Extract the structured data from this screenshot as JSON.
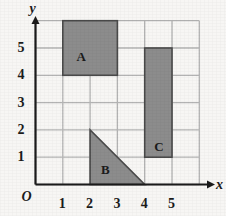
{
  "figure": {
    "title": "",
    "background_color": "#f7f6f4",
    "grid_color": "#b3b3b3",
    "axis_color": "#1b1b1b",
    "shape_fill": "#8c8c8c",
    "shape_stroke": "#4a4a4a"
  },
  "axes": {
    "x_axis_name": "x",
    "y_axis_name": "y",
    "origin_label": "O",
    "x_ticks": [
      "1",
      "2",
      "3",
      "4",
      "5"
    ],
    "y_ticks": [
      "1",
      "2",
      "3",
      "4",
      "5"
    ],
    "x_range": [
      0,
      6
    ],
    "y_range": [
      0,
      6
    ]
  },
  "shapes": [
    {
      "label": "A",
      "type": "rectangle",
      "x1": 1,
      "y1": 4,
      "x2": 3,
      "y2": 6,
      "label_x": 1.5,
      "label_y": 4.6
    },
    {
      "label": "B",
      "type": "triangle",
      "vertices": [
        [
          2,
          2
        ],
        [
          2,
          0
        ],
        [
          4,
          0
        ]
      ],
      "label_x": 2.4,
      "label_y": 0.45
    },
    {
      "label": "C",
      "type": "rectangle",
      "x1": 4,
      "y1": 1,
      "x2": 5,
      "y2": 5,
      "label_x": 4.35,
      "label_y": 1.3
    }
  ],
  "chart_data": {
    "type": "scatter",
    "title": "",
    "xlabel": "x",
    "ylabel": "y",
    "xlim": [
      0,
      6
    ],
    "ylim": [
      0,
      6
    ],
    "grid": true,
    "legend": "none",
    "annotations": [
      "A",
      "B",
      "C",
      "O"
    ],
    "series": [
      {
        "name": "A",
        "shape": "rectangle",
        "points": [
          [
            1,
            4
          ],
          [
            3,
            4
          ],
          [
            3,
            6
          ],
          [
            1,
            6
          ]
        ],
        "area": 4
      },
      {
        "name": "B",
        "shape": "triangle",
        "points": [
          [
            2,
            2
          ],
          [
            2,
            0
          ],
          [
            4,
            0
          ]
        ],
        "area": 2
      },
      {
        "name": "C",
        "shape": "rectangle",
        "points": [
          [
            4,
            1
          ],
          [
            5,
            1
          ],
          [
            5,
            5
          ],
          [
            4,
            5
          ]
        ],
        "area": 4
      }
    ]
  }
}
